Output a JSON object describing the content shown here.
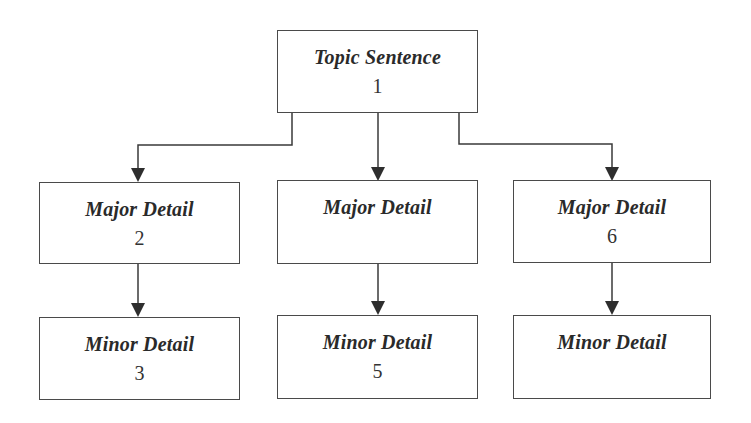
{
  "diagram": {
    "type": "hierarchy",
    "nodes": {
      "topic": {
        "title": "Topic Sentence",
        "number": "1"
      },
      "major_left": {
        "title": "Major Detail",
        "number": "2"
      },
      "major_middle": {
        "title": "Major Detail",
        "number": ""
      },
      "major_right": {
        "title": "Major Detail",
        "number": "6"
      },
      "minor_left": {
        "title": "Minor Detail",
        "number": "3"
      },
      "minor_middle": {
        "title": "Minor Detail",
        "number": "5"
      },
      "minor_right": {
        "title": "Minor Detail",
        "number": ""
      }
    },
    "edges": [
      [
        "topic",
        "major_left"
      ],
      [
        "topic",
        "major_middle"
      ],
      [
        "topic",
        "major_right"
      ],
      [
        "major_left",
        "minor_left"
      ],
      [
        "major_middle",
        "minor_middle"
      ],
      [
        "major_right",
        "minor_right"
      ]
    ],
    "colors": {
      "line": "#3a3a3a",
      "text": "#2a2a2a",
      "background": "#ffffff"
    }
  }
}
